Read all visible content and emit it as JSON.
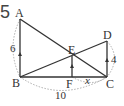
{
  "problem_number": "5",
  "points": {
    "A": {
      "label": "A",
      "x": 20,
      "y": 19
    },
    "B": {
      "label": "B",
      "x": 20,
      "y": 77
    },
    "C": {
      "label": "C",
      "x": 107,
      "y": 77
    },
    "D": {
      "label": "D",
      "x": 107,
      "y": 41
    },
    "E": {
      "label": "E",
      "x": 72,
      "y": 56
    },
    "F": {
      "label": "F",
      "x": 72,
      "y": 77
    }
  },
  "measurements": {
    "AB": "6",
    "DC": "4",
    "BC": "10",
    "FC": "x"
  },
  "colors": {
    "line": "#333333",
    "dashed": "#999999"
  }
}
